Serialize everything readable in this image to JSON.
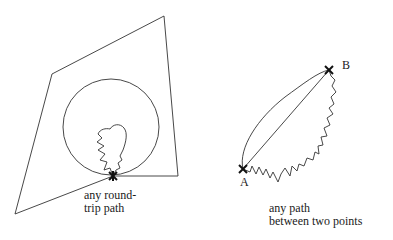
{
  "left_diagram": {
    "caption_line1": "any round-",
    "caption_line2": "trip path"
  },
  "right_diagram": {
    "point_a": "A",
    "point_b": "B",
    "caption_line1": "any path",
    "caption_line2": "between two points"
  },
  "colors": {
    "stroke": "#333333",
    "background": "#ffffff"
  }
}
